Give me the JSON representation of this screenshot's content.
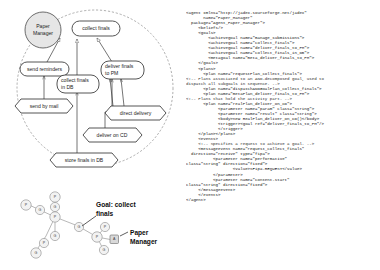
{
  "diagram": {
    "capability_label": "Paper Manager",
    "legend": {
      "goal_label_line1": "Goal: collect",
      "goal_label_line2": "finals",
      "agent_label_line1": "Paper",
      "agent_label_line2": "Manager"
    },
    "nodes": [
      {
        "id": "paper-manager-capability",
        "label_line1": "Paper",
        "label_line2": "Manager",
        "shape": "circle"
      },
      {
        "id": "collect-finals",
        "label_line1": "collect finals",
        "label_line2": "",
        "shape": "rounded"
      },
      {
        "id": "send-reminders",
        "label_line1": "send reminders",
        "label_line2": "",
        "shape": "rounded"
      },
      {
        "id": "collect-finals-in-db",
        "label_line1": "collect finals",
        "label_line2": "in DB",
        "shape": "rounded"
      },
      {
        "id": "deliver-finals-to-pm",
        "label_line1": "deliver finals",
        "label_line2": "to PM",
        "shape": "rounded"
      },
      {
        "id": "send-by-mail",
        "label_line1": "send by mail",
        "label_line2": "",
        "shape": "hexagon"
      },
      {
        "id": "direct-delivery",
        "label_line1": "direct delivery",
        "label_line2": "",
        "shape": "hexagon"
      },
      {
        "id": "deliver-on-cd",
        "label_line1": "deliver on CD",
        "label_line2": "",
        "shape": "hexagon"
      },
      {
        "id": "store-finals-in-db",
        "label_line1": "store finals in DB",
        "label_line2": "",
        "shape": "hexagon"
      }
    ],
    "graph_node_glyphs": [
      "P",
      "G",
      "P",
      "G",
      "P",
      "G",
      "P",
      "G",
      "G",
      "P",
      "P",
      "G",
      "P",
      "P"
    ],
    "agent_glyph": "A"
  },
  "code": {
    "language": "xml",
    "lines": [
      {
        "indent": 0,
        "text": "<agent xmlns=\"http://jadex.sourceforge.net/jadex\"",
        "comment": false
      },
      {
        "indent": 7,
        "text": "name=\"Paper_Manager\"",
        "comment": false
      },
      {
        "indent": 2,
        "text": "package=\"Agent_Paper_Manager\">",
        "comment": false
      },
      {
        "indent": 5,
        "text": "<beliefs/>",
        "comment": false
      },
      {
        "indent": 5,
        "text": "<goals>",
        "comment": false
      },
      {
        "indent": 9,
        "text": "<achievegoal name=\"manage_submissions\">",
        "comment": false
      },
      {
        "indent": 9,
        "text": "<achievegoal name=\"collect_finals\">",
        "comment": false
      },
      {
        "indent": 9,
        "text": "<achievegoal name=\"deliver_finals_to_PM\">",
        "comment": false
      },
      {
        "indent": 9,
        "text": "<achievegoal name=\"collect_finals_in_DB\">",
        "comment": false
      },
      {
        "indent": 9,
        "text": "<metagoal name=\"meta_deliver_finals_to_PM\">",
        "comment": false
      },
      {
        "indent": 5,
        "text": "</goals>",
        "comment": false
      },
      {
        "indent": 5,
        "text": "<plans>",
        "comment": false
      },
      {
        "indent": 7,
        "text": "<plan name=\"requestPlan_collect_finals\">",
        "comment": false
      },
      {
        "indent": 0,
        "text": "<!-- Plans associated to an AND-decomposed goal, used to",
        "comment": true
      },
      {
        "indent": 0,
        "text": "dispatch all subgoals in sequence. -->",
        "comment": true
      },
      {
        "indent": 7,
        "text": "<plan name=\"dispatchANDGoalPlan_collect_finals\">",
        "comment": false
      },
      {
        "indent": 7,
        "text": "<plan name=\"metaPlan_deliver_finals_to_PM\">",
        "comment": false
      },
      {
        "indent": 0,
        "text": "<!-- Plans that hold the activity part. -->",
        "comment": true
      },
      {
        "indent": 7,
        "text": "<plan name=\"realPlan_deliver_on_CD\">",
        "comment": false
      },
      {
        "indent": 13,
        "text": "<parameter name=\"param\" class=\"String\">",
        "comment": false
      },
      {
        "indent": 13,
        "text": "<parameter name=\"result\" class=\"String\">",
        "comment": false
      },
      {
        "indent": 13,
        "text": "<body>new RealPlan_deliver_on_CD()</body>",
        "comment": false
      },
      {
        "indent": 13,
        "text": "<trigger><goal ref=\"deliver_finals_to_PM\"/>",
        "comment": false
      },
      {
        "indent": 13,
        "text": "</trigger>",
        "comment": false
      },
      {
        "indent": 5,
        "text": "</plan></plans>",
        "comment": false
      },
      {
        "indent": 5,
        "text": "<events>",
        "comment": false
      },
      {
        "indent": 5,
        "text": "<!-- Specifies a request to achieve a goal. -->",
        "comment": true
      },
      {
        "indent": 5,
        "text": "<messageevent name=\"request_collect_finals\"",
        "comment": false
      },
      {
        "indent": 2,
        "text": "direction=\"receive\" type=\"fipa\">",
        "comment": false
      },
      {
        "indent": 11,
        "text": "<parameter name=\"performative\"",
        "comment": false
      },
      {
        "indent": 0,
        "text": "class=\"String\" direction=\"fixed\">",
        "comment": false
      },
      {
        "indent": 19,
        "text": "<value>SFipa.REQUEST</value>",
        "comment": false
      },
      {
        "indent": 11,
        "text": "</parameter>",
        "comment": false
      },
      {
        "indent": 11,
        "text": "<parameter name=\"content-start\"",
        "comment": false
      },
      {
        "indent": 0,
        "text": "class=\"String\" direction=\"fixed\">",
        "comment": false
      },
      {
        "indent": 5,
        "text": "</messageevent>",
        "comment": false
      },
      {
        "indent": 5,
        "text": "</events>",
        "comment": false
      },
      {
        "indent": 0,
        "text": "</agent>",
        "comment": false
      }
    ]
  }
}
